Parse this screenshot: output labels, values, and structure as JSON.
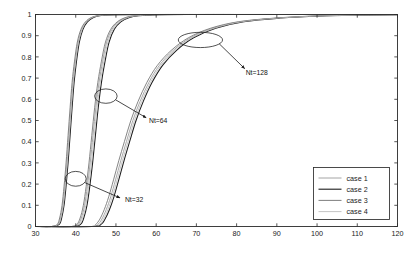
{
  "chart_data": {
    "type": "line",
    "title": "",
    "xlabel": "",
    "ylabel": "",
    "xlim": [
      30,
      120
    ],
    "ylim": [
      0,
      1
    ],
    "xticks": [
      30,
      40,
      50,
      60,
      70,
      80,
      90,
      100,
      110,
      120
    ],
    "yticks": [
      0,
      0.1,
      0.2,
      0.3,
      0.4,
      0.5,
      0.6,
      0.7,
      0.8,
      0.9,
      1
    ],
    "xtick_labels": [
      "30",
      "40",
      "50",
      "60",
      "70",
      "80",
      "90",
      "100",
      "110",
      "120"
    ],
    "ytick_labels": [
      "0",
      "0.1",
      "0.2",
      "0.3",
      "0.4",
      "0.5",
      "0.6",
      "0.7",
      "0.8",
      "0.9",
      "1"
    ],
    "grid": false,
    "legend_position": "lower right",
    "legend_entries": [
      "case 1",
      "case 2",
      "case 3",
      "case 4"
    ],
    "series_colors": [
      "#9a9a9a",
      "#1c1c1c",
      "#6f6f6f",
      "#bdbdbd"
    ],
    "groups": [
      {
        "name": "Nt=32",
        "annotation": "Nt=32",
        "series": [
          {
            "name": "case 1",
            "x": [
              30,
              34,
              35.6,
              36.2,
              36.8,
              37.3,
              37.8,
              38.3,
              38.8,
              39.3,
              39.9,
              40.6,
              41.5,
              42.6,
              44,
              46,
              50,
              60,
              80,
              100,
              120
            ],
            "y": [
              0,
              0,
              0.01,
              0.04,
              0.1,
              0.19,
              0.3,
              0.43,
              0.56,
              0.68,
              0.78,
              0.87,
              0.93,
              0.965,
              0.985,
              0.995,
              0.999,
              1,
              1,
              1,
              1
            ]
          },
          {
            "name": "case 2",
            "x": [
              30,
              34,
              35.9,
              36.5,
              37.1,
              37.6,
              38.1,
              38.6,
              39.1,
              39.6,
              40.2,
              40.9,
              41.8,
              42.9,
              44.3,
              46.3,
              50,
              60,
              80,
              100,
              120
            ],
            "y": [
              0,
              0,
              0.01,
              0.04,
              0.1,
              0.19,
              0.3,
              0.43,
              0.56,
              0.68,
              0.78,
              0.87,
              0.93,
              0.965,
              0.985,
              0.995,
              0.999,
              1,
              1,
              1,
              1
            ]
          },
          {
            "name": "case 3",
            "x": [
              30,
              34,
              35.4,
              36.0,
              36.6,
              37.1,
              37.6,
              38.1,
              38.6,
              39.1,
              39.7,
              40.4,
              41.3,
              42.4,
              43.8,
              45.8,
              49.8,
              60,
              80,
              100,
              120
            ],
            "y": [
              0,
              0,
              0.01,
              0.04,
              0.1,
              0.19,
              0.3,
              0.43,
              0.56,
              0.68,
              0.78,
              0.87,
              0.93,
              0.965,
              0.985,
              0.995,
              0.999,
              1,
              1,
              1,
              1
            ]
          },
          {
            "name": "case 4",
            "x": [
              30,
              34,
              35.7,
              36.3,
              36.9,
              37.4,
              37.9,
              38.4,
              38.9,
              39.4,
              40.0,
              40.7,
              41.6,
              42.7,
              44.1,
              46.1,
              50,
              60,
              80,
              100,
              120
            ],
            "y": [
              0,
              0,
              0.01,
              0.04,
              0.1,
              0.19,
              0.3,
              0.43,
              0.56,
              0.68,
              0.78,
              0.87,
              0.93,
              0.965,
              0.985,
              0.995,
              0.999,
              1,
              1,
              1,
              1
            ]
          }
        ]
      },
      {
        "name": "Nt=64",
        "annotation": "Nt=64",
        "series": [
          {
            "name": "case 1",
            "x": [
              30,
              39,
              40.6,
              41.4,
              42.2,
              42.9,
              43.6,
              44.3,
              45.0,
              45.8,
              46.7,
              47.7,
              49.0,
              50.6,
              52.6,
              55,
              60,
              70,
              90,
              110,
              120
            ],
            "y": [
              0,
              0,
              0.01,
              0.04,
              0.1,
              0.19,
              0.3,
              0.43,
              0.56,
              0.68,
              0.78,
              0.87,
              0.93,
              0.965,
              0.985,
              0.994,
              0.999,
              1,
              1,
              1,
              1
            ]
          },
          {
            "name": "case 2",
            "x": [
              30,
              39,
              41.2,
              42.0,
              42.8,
              43.5,
              44.2,
              44.9,
              45.6,
              46.4,
              47.3,
              48.3,
              49.6,
              51.2,
              53.2,
              55.6,
              60.6,
              70,
              90,
              110,
              120
            ],
            "y": [
              0,
              0,
              0.01,
              0.04,
              0.1,
              0.19,
              0.3,
              0.43,
              0.56,
              0.68,
              0.78,
              0.87,
              0.93,
              0.965,
              0.985,
              0.994,
              0.999,
              1,
              1,
              1,
              1
            ]
          },
          {
            "name": "case 3",
            "x": [
              30,
              39,
              40.3,
              41.1,
              41.9,
              42.6,
              43.3,
              44.0,
              44.7,
              45.5,
              46.4,
              47.4,
              48.7,
              50.3,
              52.3,
              54.7,
              59.7,
              70,
              90,
              110,
              120
            ],
            "y": [
              0,
              0,
              0.01,
              0.04,
              0.1,
              0.19,
              0.3,
              0.43,
              0.56,
              0.68,
              0.78,
              0.87,
              0.93,
              0.965,
              0.985,
              0.994,
              0.999,
              1,
              1,
              1,
              1
            ]
          },
          {
            "name": "case 4",
            "x": [
              30,
              39,
              40.9,
              41.7,
              42.5,
              43.2,
              43.9,
              44.6,
              45.3,
              46.1,
              47.0,
              48.0,
              49.3,
              50.9,
              52.9,
              55.3,
              60.3,
              70,
              90,
              110,
              120
            ],
            "y": [
              0,
              0,
              0.01,
              0.04,
              0.1,
              0.19,
              0.3,
              0.43,
              0.56,
              0.68,
              0.78,
              0.87,
              0.93,
              0.965,
              0.985,
              0.994,
              0.999,
              1,
              1,
              1,
              1
            ]
          }
        ]
      },
      {
        "name": "Nt=128",
        "annotation": "Nt=128",
        "series": [
          {
            "name": "case 1",
            "x": [
              30,
              44,
              45.5,
              46.5,
              47.6,
              48.7,
              49.9,
              51.2,
              52.6,
              54.2,
              56.0,
              58.2,
              60.8,
              64.2,
              68.5,
              74,
              81,
              90,
              100,
              110,
              120
            ],
            "y": [
              0,
              0,
              0.01,
              0.035,
              0.08,
              0.14,
              0.22,
              0.31,
              0.4,
              0.5,
              0.59,
              0.68,
              0.76,
              0.83,
              0.89,
              0.935,
              0.966,
              0.983,
              0.993,
              0.997,
              0.999
            ]
          },
          {
            "name": "case 2",
            "x": [
              30,
              44,
              46.3,
              47.3,
              48.4,
              49.5,
              50.7,
              52.0,
              53.4,
              55.0,
              56.8,
              59.0,
              61.6,
              65.0,
              69.3,
              74.8,
              81.8,
              90.8,
              100.8,
              110.8,
              120
            ],
            "y": [
              0,
              0,
              0.01,
              0.035,
              0.08,
              0.14,
              0.22,
              0.31,
              0.4,
              0.5,
              0.59,
              0.68,
              0.76,
              0.83,
              0.89,
              0.935,
              0.966,
              0.983,
              0.993,
              0.997,
              0.999
            ]
          },
          {
            "name": "case 3",
            "x": [
              30,
              44,
              45.0,
              46.0,
              47.1,
              48.2,
              49.4,
              50.7,
              52.1,
              53.7,
              55.5,
              57.7,
              60.3,
              63.7,
              68.0,
              73.5,
              80.5,
              89.5,
              99.5,
              109.5,
              120
            ],
            "y": [
              0,
              0,
              0.01,
              0.035,
              0.08,
              0.14,
              0.22,
              0.31,
              0.4,
              0.5,
              0.59,
              0.68,
              0.76,
              0.83,
              0.89,
              0.935,
              0.966,
              0.983,
              0.993,
              0.997,
              0.999
            ]
          },
          {
            "name": "case 4",
            "x": [
              30,
              44,
              45.9,
              46.9,
              48.0,
              49.1,
              50.3,
              51.6,
              53.0,
              54.6,
              56.4,
              58.6,
              61.2,
              64.6,
              68.9,
              74.4,
              81.4,
              90.4,
              100.4,
              110.4,
              120
            ],
            "y": [
              0,
              0,
              0.01,
              0.035,
              0.08,
              0.14,
              0.22,
              0.31,
              0.4,
              0.5,
              0.59,
              0.68,
              0.76,
              0.83,
              0.89,
              0.935,
              0.966,
              0.983,
              0.993,
              0.997,
              0.999
            ]
          }
        ]
      }
    ],
    "annotations": [
      {
        "label": "Nt=32",
        "ellipse_x": 40.0,
        "ellipse_y": 0.225,
        "ellipse_rx": 2.6,
        "ellipse_ry": 0.035,
        "text_x": 54.5,
        "text_y": 0.125,
        "arrow_to_x": 51.0,
        "arrow_to_y": 0.135
      },
      {
        "label": "Nt=64",
        "ellipse_x": 47.5,
        "ellipse_y": 0.615,
        "ellipse_rx": 2.8,
        "ellipse_ry": 0.034,
        "text_x": 60.5,
        "text_y": 0.5,
        "arrow_to_x": 57.5,
        "arrow_to_y": 0.513
      },
      {
        "label": "Nt=128",
        "ellipse_x": 71.0,
        "ellipse_y": 0.88,
        "ellipse_rx": 5.5,
        "ellipse_ry": 0.036,
        "text_x": 85.0,
        "text_y": 0.725,
        "arrow_to_x": 82.0,
        "arrow_to_y": 0.745
      }
    ]
  },
  "legend": {
    "items": [
      {
        "label": "case 1"
      },
      {
        "label": "case 2"
      },
      {
        "label": "case 3"
      },
      {
        "label": "case 4"
      }
    ]
  }
}
